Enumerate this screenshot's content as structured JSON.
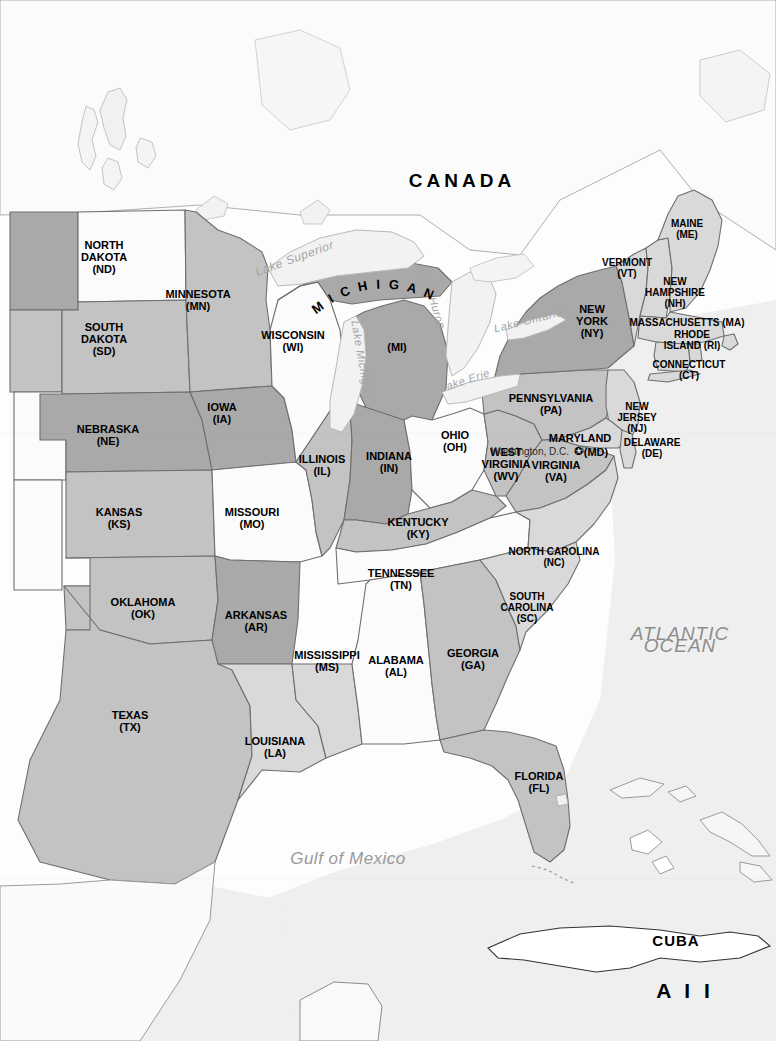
{
  "map": {
    "title": "Map of the Eastern United States",
    "projection_note": "reference outline map",
    "colors": {
      "ocean": "#efefef",
      "land_outside": "#f7f7f7",
      "tier_white": "#fbfbfb",
      "tier_light": "#d9d9d9",
      "tier_medium": "#c3c3c3",
      "tier_dark": "#a9a9a9",
      "lake": "#f2f2f2",
      "border": "#6e6e6e",
      "coast": "#555555",
      "label": "#000000",
      "water_label": "#a5a5a5"
    }
  },
  "countries": [
    {
      "name": "CANADA",
      "x": 462,
      "y": 181,
      "class": "country"
    },
    {
      "name": "CUBA",
      "x": 676,
      "y": 941,
      "class": "cuba"
    }
  ],
  "extra_labels": [
    {
      "name": "A I I",
      "x": 685,
      "y": 991,
      "class": "all"
    }
  ],
  "oceans": [
    {
      "lines": [
        "ATLANTIC",
        "OCEAN"
      ],
      "x": 680,
      "y": 640,
      "class": "ocean"
    },
    {
      "lines": [
        "Gulf of Mexico"
      ],
      "x": 348,
      "y": 859,
      "class": "gulf"
    }
  ],
  "capital": {
    "name": "Washington, D.C.",
    "x": 530,
    "y": 452,
    "marker": "star-marker",
    "marker_x": 578,
    "marker_y": 451
  },
  "lakes": [
    {
      "name": "Lake Superior",
      "x": 296,
      "y": 262,
      "rotate": -20,
      "size": "big"
    },
    {
      "name": "Lake Michigan",
      "x": 358,
      "y": 360,
      "rotate": 80
    },
    {
      "name": "Lake Huron",
      "x": 429,
      "y": 300,
      "rotate": 72
    },
    {
      "name": "Lake Erie",
      "x": 466,
      "y": 384,
      "rotate": -22
    },
    {
      "name": "Lake Ontario",
      "x": 529,
      "y": 324,
      "rotate": -14
    }
  ],
  "states": [
    {
      "code": "ND",
      "name": "NORTH\nDAKOTA",
      "abbr": "(ND)",
      "x": 104,
      "y": 257,
      "shade": "white"
    },
    {
      "code": "SD",
      "name": "SOUTH\nDAKOTA",
      "abbr": "(SD)",
      "x": 104,
      "y": 339,
      "shade": "medium"
    },
    {
      "code": "NE",
      "name": "NEBRASKA",
      "abbr": "(NE)",
      "x": 108,
      "y": 435,
      "shade": "dark"
    },
    {
      "code": "KS",
      "name": "KANSAS",
      "abbr": "(KS)",
      "x": 119,
      "y": 518,
      "shade": "medium"
    },
    {
      "code": "OK",
      "name": "OKLAHOMA",
      "abbr": "(OK)",
      "x": 143,
      "y": 608,
      "shade": "medium"
    },
    {
      "code": "TX",
      "name": "TEXAS",
      "abbr": "(TX)",
      "x": 130,
      "y": 721,
      "shade": "medium"
    },
    {
      "code": "MN",
      "name": "MINNESOTA",
      "abbr": "(MN)",
      "x": 198,
      "y": 300,
      "shade": "medium"
    },
    {
      "code": "IA",
      "name": "IOWA",
      "abbr": "(IA)",
      "x": 222,
      "y": 413,
      "shade": "dark"
    },
    {
      "code": "MO",
      "name": "MISSOURI",
      "abbr": "(MO)",
      "x": 252,
      "y": 518,
      "shade": "white"
    },
    {
      "code": "AR",
      "name": "ARKANSAS",
      "abbr": "(AR)",
      "x": 256,
      "y": 621,
      "shade": "dark"
    },
    {
      "code": "LA",
      "name": "LOUISIANA",
      "abbr": "(LA)",
      "x": 275,
      "y": 747,
      "shade": "light"
    },
    {
      "code": "WI",
      "name": "WISCONSIN",
      "abbr": "(WI)",
      "x": 293,
      "y": 341,
      "shade": "white"
    },
    {
      "code": "IL",
      "name": "ILLINOIS",
      "abbr": "(IL)",
      "x": 322,
      "y": 465,
      "shade": "medium"
    },
    {
      "code": "MS",
      "name": "MISSISSIPPI",
      "abbr": "(MS)",
      "x": 327,
      "y": 661,
      "shade": "light"
    },
    {
      "code": "MI",
      "name": "MICHIGAN",
      "abbr": "(MI)",
      "x": 397,
      "y": 347,
      "shade": "dark",
      "arched": true,
      "arc_x": 361,
      "arc_y": 296
    },
    {
      "code": "IN",
      "name": "INDIANA",
      "abbr": "(IN)",
      "x": 389,
      "y": 462,
      "shade": "dark"
    },
    {
      "code": "KY",
      "name": "KENTUCKY",
      "abbr": "(KY)",
      "x": 418,
      "y": 528,
      "shade": "medium"
    },
    {
      "code": "TN",
      "name": "TENNESSEE",
      "abbr": "(TN)",
      "x": 401,
      "y": 579,
      "shade": "white"
    },
    {
      "code": "AL",
      "name": "ALABAMA",
      "abbr": "(AL)",
      "x": 396,
      "y": 666,
      "shade": "white"
    },
    {
      "code": "OH",
      "name": "OHIO",
      "abbr": "(OH)",
      "x": 455,
      "y": 441,
      "shade": "white"
    },
    {
      "code": "GA",
      "name": "GEORGIA",
      "abbr": "(GA)",
      "x": 473,
      "y": 659,
      "shade": "medium"
    },
    {
      "code": "FL",
      "name": "FLORIDA",
      "abbr": "(FL)",
      "x": 539,
      "y": 782,
      "shade": "medium"
    },
    {
      "code": "WV",
      "name": "WEST\nVIRGINIA",
      "abbr": "(WV)",
      "x": 506,
      "y": 464,
      "shade": "medium"
    },
    {
      "code": "VA",
      "name": "VIRGINIA",
      "abbr": "(VA)",
      "x": 556,
      "y": 471,
      "shade": "medium"
    },
    {
      "code": "NC",
      "name": "NORTH CAROLINA",
      "abbr": "(NC)",
      "x": 554,
      "y": 557,
      "shade": "light"
    },
    {
      "code": "SC",
      "name": "SOUTH\nCAROLINA",
      "abbr": "(SC)",
      "x": 527,
      "y": 607,
      "shade": "light"
    },
    {
      "code": "PA",
      "name": "PENNSYLVANIA",
      "abbr": "(PA)",
      "x": 551,
      "y": 404,
      "shade": "medium"
    },
    {
      "code": "NY",
      "name": "NEW\nYORK",
      "abbr": "(NY)",
      "x": 592,
      "y": 321,
      "shade": "dark"
    },
    {
      "code": "VT",
      "name": "VERMONT",
      "abbr": "(VT)",
      "x": 627,
      "y": 268,
      "shade": "light"
    },
    {
      "code": "NH",
      "name": "NEW\nHAMPSHIRE",
      "abbr": "(NH)",
      "x": 675,
      "y": 292,
      "shade": "light"
    },
    {
      "code": "ME",
      "name": "MAINE",
      "abbr": "(ME)",
      "x": 687,
      "y": 229,
      "shade": "light"
    },
    {
      "code": "MA",
      "name": "MASSACHUSETTS (MA)",
      "abbr": "",
      "x": 687,
      "y": 322,
      "shade": "light"
    },
    {
      "code": "RI",
      "name": "RHODE\nISLAND (RI)",
      "abbr": "",
      "x": 692,
      "y": 340,
      "shade": "light"
    },
    {
      "code": "CT",
      "name": "CONNECTICUT",
      "abbr": "(CT)",
      "x": 689,
      "y": 370,
      "shade": "light"
    },
    {
      "code": "NJ",
      "name": "NEW\nJERSEY",
      "abbr": "(NJ)",
      "x": 637,
      "y": 417,
      "shade": "light"
    },
    {
      "code": "MD",
      "name": "MARYLAND",
      "abbr": "(MD)",
      "x": 580,
      "y": 438,
      "shade": "light",
      "abbr_x": 596,
      "abbr_y": 452
    },
    {
      "code": "DE",
      "name": "DELAWARE",
      "abbr": "(DE)",
      "x": 652,
      "y": 448,
      "shade": "light"
    }
  ]
}
